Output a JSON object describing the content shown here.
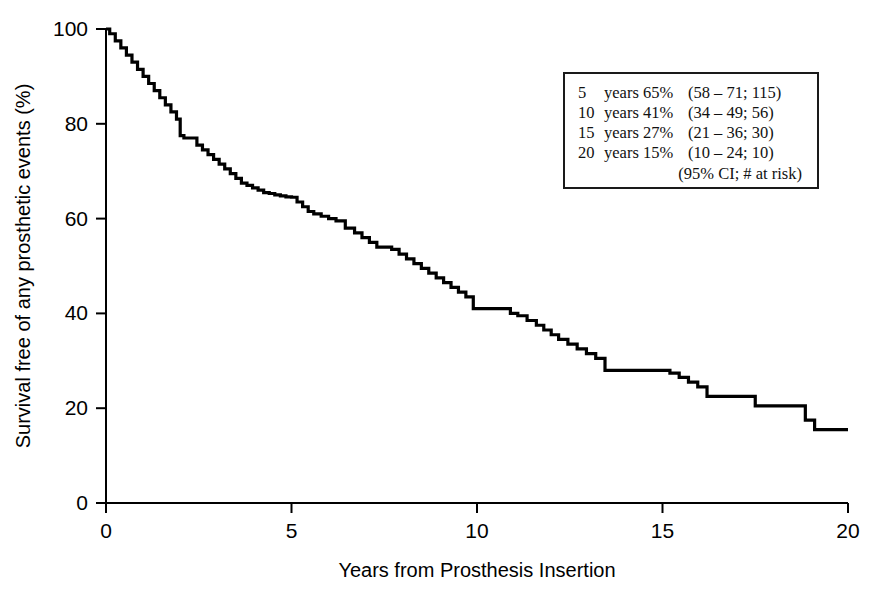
{
  "chart_data": {
    "type": "line",
    "title": "",
    "subtitle": "",
    "xlabel": "Years from Prosthesis Insertion",
    "ylabel": "Survival free of any prosthetic events (%)",
    "xlim": [
      0,
      20
    ],
    "ylim": [
      0,
      100
    ],
    "xticks": [
      "0",
      "5",
      "10",
      "15",
      "20"
    ],
    "xtick_values": [
      0,
      5,
      10,
      15,
      20
    ],
    "yticks": [
      "0",
      "20",
      "40",
      "60",
      "80",
      "100"
    ],
    "ytick_values": [
      0,
      20,
      40,
      60,
      80,
      100
    ],
    "grid": false,
    "legend_position": "upper-right-inset",
    "curve_style": "kaplan-meier-step",
    "series": [
      {
        "name": "Survival free of any prosthetic events",
        "color": "#000000",
        "x": [
          0,
          0.1,
          0.25,
          0.4,
          0.55,
          0.7,
          0.85,
          1.0,
          1.15,
          1.3,
          1.45,
          1.6,
          1.75,
          1.9,
          2.0,
          2.1,
          2.25,
          2.45,
          2.6,
          2.75,
          2.9,
          3.05,
          3.2,
          3.35,
          3.5,
          3.65,
          3.8,
          3.95,
          4.1,
          4.25,
          4.4,
          4.55,
          4.7,
          4.85,
          5.0,
          5.15,
          5.3,
          5.45,
          5.6,
          5.8,
          6.0,
          6.2,
          6.45,
          6.7,
          6.9,
          7.1,
          7.3,
          7.5,
          7.7,
          7.9,
          8.1,
          8.3,
          8.5,
          8.7,
          8.9,
          9.1,
          9.3,
          9.5,
          9.7,
          9.9,
          10.7,
          10.9,
          11.1,
          11.35,
          11.6,
          11.8,
          12.0,
          12.2,
          12.45,
          12.7,
          12.95,
          13.2,
          13.45,
          15.0,
          15.2,
          15.45,
          15.7,
          15.95,
          16.2,
          17.3,
          17.5,
          18.6,
          18.85,
          19.1,
          20.0
        ],
        "y": [
          100,
          99,
          97.5,
          96,
          94.5,
          93,
          91.5,
          90,
          88.5,
          87,
          85.5,
          84,
          82.5,
          81,
          77.5,
          77,
          77,
          75.5,
          74.5,
          73.5,
          72.5,
          71.5,
          70.5,
          69.5,
          68.5,
          67.5,
          67,
          66.5,
          66,
          65.5,
          65.3,
          65,
          64.8,
          64.6,
          64.5,
          63.5,
          62.5,
          61.5,
          61,
          60.5,
          60,
          59.5,
          58,
          57,
          56,
          55,
          54,
          54,
          53.5,
          52.5,
          51.5,
          50.5,
          49.5,
          48.5,
          47.5,
          46.5,
          45.5,
          44.5,
          43.5,
          41,
          41,
          40,
          39.5,
          38.5,
          37.5,
          36.5,
          35.5,
          34.5,
          33.5,
          32.5,
          31.5,
          30.5,
          28,
          28,
          27.4,
          26.5,
          25.5,
          24.5,
          22.5,
          22.5,
          20.5,
          20.5,
          17.5,
          15.5,
          15.5
        ]
      }
    ],
    "annotations": [
      "5 years 65% (58-71; 115 at risk)",
      "10 years 41% (34-49; 56 at risk)",
      "15 years 27% (21-36; 30 at risk)",
      "20 years 15% (10-24; 10 at risk)"
    ]
  },
  "axes": {
    "x_title": "Years from Prosthesis Insertion",
    "y_title": "Survival free of any prosthetic events (%)",
    "x_tick_labels": [
      "0",
      "5",
      "10",
      "15",
      "20"
    ],
    "y_tick_labels": [
      "0",
      "20",
      "40",
      "60",
      "80",
      "100"
    ]
  },
  "legend": {
    "rows": [
      {
        "time": "5",
        "label": "years 65%",
        "ci": "(58 – 71; 115)"
      },
      {
        "time": "10",
        "label": "years 41%",
        "ci": "(34 – 49; 56)"
      },
      {
        "time": "15",
        "label": "years 27%",
        "ci": "(21 – 36; 30)"
      },
      {
        "time": "20",
        "label": "years 15%",
        "ci": "(10 – 24; 10)"
      }
    ],
    "footer": "(95% CI; # at risk)"
  },
  "colors": {
    "curve": "#000000",
    "axis": "#000000",
    "background": "#ffffff",
    "legend_border": "#1a1a1a"
  }
}
